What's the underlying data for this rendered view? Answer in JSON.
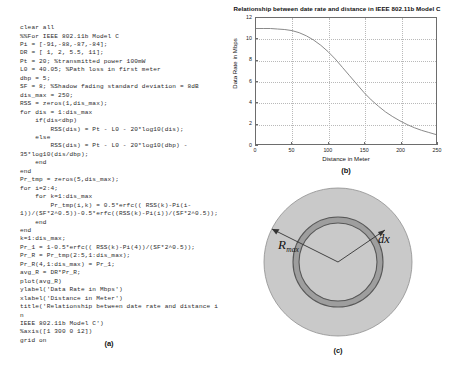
{
  "figure": {
    "panels": {
      "a": {
        "caption": "(a)"
      },
      "b": {
        "caption": "(b)"
      },
      "c": {
        "caption": "(c)"
      }
    }
  },
  "code": {
    "language": "MATLAB",
    "listing": "clear all\n%%For IEEE 802.11b Model C\nPi = [-91,-88,-87,-84];\nDR = [ 1, 2, 5.5, 11];\nPt = 20; %transmitted power 100mW\nL0 = 40.05; %Path loss in first meter\ndbp = 5;\nSF = 8; %Shadow fading standard deviation = 8dB\ndis_max = 250;\nRSS = zeros(1,dis_max);\nfor dis = 1:dis_max\n    if(dis<dbp)\n        RSS(dis) = Pt - L0 - 20*log10(dis);\n    else\n        RSS(dis) = Pt - L0 - 20*log10(dbp) -\n35*log10(dis/dbp);\n    end\nend\nPr_tmp = zeros(5,dis_max);\nfor i=2:4;\n    for k=1:dis_max\n        Pr_tmp(i,k) = 0.5*erfc(( RSS(k)-Pi(i-\n1))/(SF*2^0.5))-0.5*erfc((RSS(k)-Pi(i))/(SF*2^0.5));\n    end\nend\nk=1:dis_max;\nPr_1 = 1-0.5*erfc(( RSS(k)-Pi(4))/(SF*2^0.5));\nPr_R = Pr_tmp(2:5,1:dis_max);\nPr_R(4,1:dis_max) = Pr_1;\navg_R = DR*Pr_R;\nplot(avg_R)\nylabel('Data Rate in Mbps')\nxlabel('Distance in Meter')\ntitle('Relationship between date rate and distance in\nIEEE 802.11b Model C')\n%axis([1 300 0 12])\ngrid on"
  },
  "chart_data": {
    "type": "line",
    "title": "Relationship between date rate and distance in IEEE 802.11b Model C",
    "xlabel": "Distance in Meter",
    "ylabel": "Data Rate in Mbps",
    "xlim": [
      0,
      250
    ],
    "ylim": [
      0,
      12
    ],
    "xticks": [
      0,
      50,
      100,
      150,
      200,
      250
    ],
    "yticks": [
      0,
      2,
      4,
      6,
      8,
      10,
      12
    ],
    "grid": true,
    "legend": "none",
    "line_color": "#8a8a8a",
    "series": [
      {
        "name": "avg_R",
        "x": [
          0,
          10,
          20,
          30,
          40,
          50,
          60,
          70,
          80,
          90,
          100,
          110,
          120,
          130,
          140,
          150,
          160,
          170,
          180,
          190,
          200,
          210,
          220,
          230,
          240,
          250
        ],
        "y": [
          11.0,
          11.0,
          11.0,
          10.95,
          10.9,
          10.8,
          10.6,
          10.3,
          9.9,
          9.4,
          8.8,
          8.1,
          7.3,
          6.5,
          5.7,
          4.9,
          4.2,
          3.6,
          3.05,
          2.6,
          2.2,
          1.85,
          1.55,
          1.3,
          1.1,
          0.9
        ]
      }
    ]
  },
  "diagram": {
    "name": "annulus-ring-diagram",
    "outer_fill": "#c9c9c9",
    "ring_fill": "#9e9e9e",
    "inner_fill": "#c9c9c9",
    "labels": {
      "rmax_base": "R",
      "rmax_sub": "max",
      "dx": "dx"
    }
  }
}
